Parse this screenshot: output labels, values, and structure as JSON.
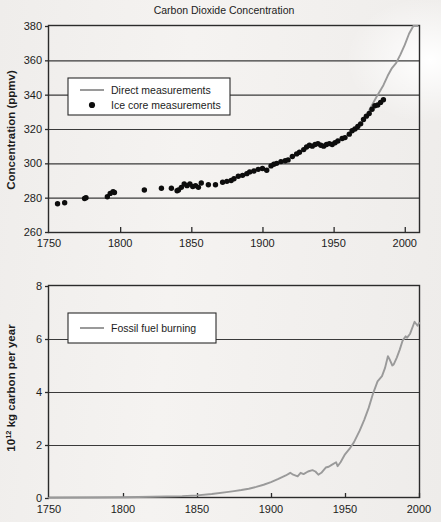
{
  "figure": {
    "background_color": "#f1efed",
    "axis_color": "#2b2b2b",
    "grid_color": "#3a3a3a",
    "data_line_color": "#9a9a9a",
    "marker_color": "#0d0d0d"
  },
  "chart_data": [
    {
      "id": "co2-concentration",
      "type": "scatter",
      "title": "Carbon Dioxide Concentration",
      "xlabel": "",
      "ylabel": "Concentration (ppmv)",
      "xlim": [
        1750,
        2010
      ],
      "ylim": [
        260,
        380
      ],
      "xticks": [
        1750,
        1800,
        1850,
        1900,
        1950,
        2000
      ],
      "xtick_labels": [
        "1750",
        "1800",
        "1850",
        "1900",
        "1950",
        "2000"
      ],
      "yticks": [
        260,
        280,
        300,
        320,
        340,
        360,
        380
      ],
      "ytick_labels": [
        "260",
        "280",
        "300",
        "320",
        "340",
        "360",
        "380"
      ],
      "grid": "horizontal",
      "legend_position": "upper-left",
      "series": [
        {
          "name": "Direct measurements",
          "marker": "line",
          "color": "#9a9a9a",
          "x": [
            1975,
            1980,
            1985,
            1988,
            1991,
            1994,
            1997,
            2000,
            2003,
            2006,
            2009
          ],
          "y": [
            331.0,
            338.5,
            345.5,
            351.0,
            355.5,
            358.5,
            363.5,
            369.0,
            375.5,
            381.5,
            387.0
          ]
        },
        {
          "name": "Ice core measurements",
          "marker": "dot",
          "color": "#0d0d0d",
          "x": [
            1756,
            1761,
            1775,
            1776,
            1791,
            1793,
            1795,
            1796,
            1817,
            1829,
            1836,
            1840,
            1841,
            1843,
            1845,
            1847,
            1849,
            1851,
            1853,
            1855,
            1857,
            1862,
            1867,
            1872,
            1875,
            1878,
            1880,
            1883,
            1886,
            1889,
            1891,
            1894,
            1897,
            1900,
            1903,
            1906,
            1908,
            1910,
            1913,
            1916,
            1918,
            1921,
            1924,
            1926,
            1929,
            1931,
            1933,
            1935,
            1937,
            1939,
            1941,
            1943,
            1945,
            1947,
            1949,
            1951,
            1953,
            1956,
            1958,
            1961,
            1963,
            1965,
            1967,
            1969,
            1971,
            1973,
            1975,
            1977,
            1979,
            1981,
            1983,
            1985
          ],
          "y": [
            276.5,
            277.0,
            279.5,
            280.0,
            280.5,
            282.5,
            283.5,
            283.0,
            284.5,
            285.5,
            285.5,
            284.0,
            284.5,
            286.0,
            288.0,
            287.0,
            288.0,
            286.5,
            287.0,
            286.0,
            288.5,
            287.5,
            287.5,
            289.0,
            289.5,
            290.0,
            291.0,
            292.5,
            293.0,
            294.0,
            295.0,
            295.5,
            296.5,
            297.0,
            296.0,
            298.5,
            299.5,
            300.0,
            301.0,
            301.5,
            302.0,
            304.0,
            305.5,
            306.5,
            308.0,
            309.5,
            310.5,
            310.0,
            311.0,
            311.5,
            310.5,
            310.0,
            311.0,
            311.5,
            311.0,
            312.0,
            313.0,
            314.5,
            315.0,
            317.0,
            319.0,
            320.0,
            321.5,
            323.0,
            325.5,
            327.5,
            329.0,
            331.5,
            333.5,
            334.0,
            335.5,
            337.0
          ]
        }
      ]
    },
    {
      "id": "fossil-fuel-burning",
      "type": "line",
      "title": "",
      "xlabel": "",
      "ylabel": "10 kg carbon per year",
      "ylabel_base": "10",
      "ylabel_exponent": "12",
      "ylabel_rest": " kg carbon per year",
      "xlim": [
        1750,
        2000
      ],
      "ylim": [
        0,
        8
      ],
      "xticks": [
        1750,
        1800,
        1850,
        1900,
        1950,
        2000
      ],
      "xtick_labels": [
        "1750",
        "1800",
        "1850",
        "1900",
        "1950",
        "2000"
      ],
      "yticks": [
        0,
        2,
        4,
        6,
        8
      ],
      "ytick_labels": [
        "0",
        "2",
        "4",
        "6",
        "8"
      ],
      "grid": "horizontal",
      "legend_position": "upper-left",
      "series": [
        {
          "name": "Fossil fuel burning",
          "marker": "line",
          "color": "#9a9a9a",
          "x": [
            1750,
            1780,
            1800,
            1820,
            1840,
            1850,
            1860,
            1870,
            1875,
            1880,
            1885,
            1890,
            1895,
            1900,
            1905,
            1910,
            1913,
            1915,
            1918,
            1920,
            1922,
            1925,
            1928,
            1930,
            1932,
            1934,
            1937,
            1939,
            1941,
            1944,
            1945,
            1947,
            1950,
            1953,
            1956,
            1960,
            1963,
            1966,
            1969,
            1972,
            1975,
            1977,
            1979,
            1980,
            1982,
            1983,
            1985,
            1987,
            1989,
            1991,
            1992,
            1994,
            1996,
            1997,
            1999,
            2000
          ],
          "y": [
            0.01,
            0.02,
            0.03,
            0.05,
            0.07,
            0.1,
            0.15,
            0.22,
            0.26,
            0.3,
            0.35,
            0.42,
            0.5,
            0.6,
            0.72,
            0.85,
            0.95,
            0.88,
            0.82,
            0.95,
            0.9,
            1.0,
            1.05,
            1.0,
            0.88,
            0.95,
            1.15,
            1.18,
            1.25,
            1.35,
            1.2,
            1.35,
            1.65,
            1.85,
            2.1,
            2.55,
            2.95,
            3.4,
            3.95,
            4.4,
            4.6,
            4.9,
            5.35,
            5.25,
            5.0,
            5.05,
            5.3,
            5.6,
            5.95,
            6.1,
            6.05,
            6.2,
            6.5,
            6.65,
            6.5,
            6.6
          ]
        }
      ]
    }
  ]
}
